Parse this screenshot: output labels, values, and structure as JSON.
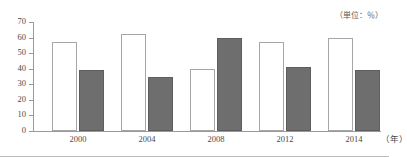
{
  "chart_data": {
    "type": "bar",
    "title": "",
    "subtitle": "",
    "unit_note": "（単位：％）",
    "xlabel": "（年）",
    "ylabel": "",
    "categories": [
      "2000",
      "2004",
      "2008",
      "2012",
      "2014"
    ],
    "series": [
      {
        "name": "light-series",
        "values": [
          57,
          62,
          40,
          57,
          60
        ],
        "color": "#ffffff"
      },
      {
        "name": "dark-series",
        "values": [
          39,
          35,
          60,
          41,
          39
        ],
        "color": "#6e6e6e"
      }
    ],
    "ylim": [
      0,
      70
    ],
    "yticks": [
      "0",
      "10",
      "20",
      "30",
      "40",
      "50",
      "60",
      "70"
    ],
    "grid": false,
    "legend": "none"
  },
  "axis": {
    "y_ticks": [
      "70",
      "60",
      "50",
      "40",
      "30",
      "20",
      "10",
      "0"
    ],
    "x_ticks": [
      "2000",
      "2004",
      "2008",
      "2012",
      "2014"
    ],
    "x_unit": "（年）"
  },
  "annotations": {
    "unit": "（単位：％）"
  }
}
